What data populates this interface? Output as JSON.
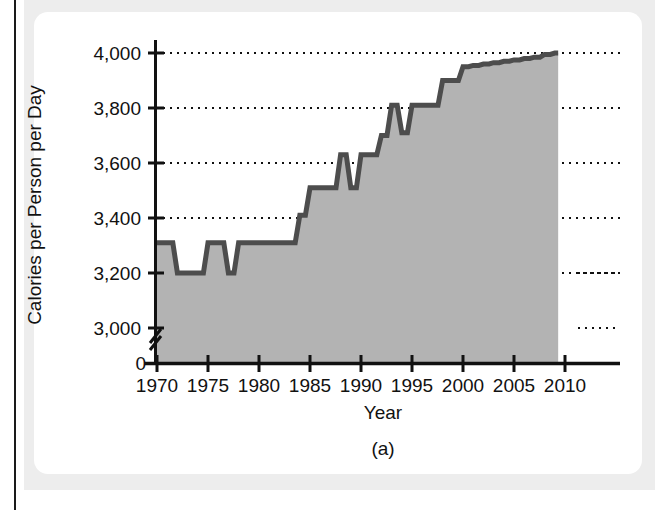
{
  "figure": {
    "caption": "(a)",
    "panel_bg": "#ffffff",
    "page_bg": "#ededed"
  },
  "chart_data": {
    "type": "area",
    "title": "",
    "subtitle": "",
    "xlabel": "Year",
    "ylabel": "Calories per Person per Day",
    "xlim": [
      1970,
      2010
    ],
    "ylim": [
      3000,
      4000
    ],
    "y_axis_break": true,
    "y_break_label": "0",
    "grid": true,
    "grid_style": "dotted-horizontal",
    "legend": "none",
    "series_color": "#4d4d4d",
    "fill_color": "#b3b3b3",
    "xticks": [
      1970,
      1975,
      1980,
      1985,
      1990,
      1995,
      2000,
      2005,
      2010
    ],
    "xtick_labels": [
      "1970",
      "1975",
      "1980",
      "1985",
      "1990",
      "1995",
      "2000",
      "2005",
      "2010"
    ],
    "yticks": [
      3000,
      3200,
      3400,
      3600,
      3800,
      4000
    ],
    "ytick_labels": [
      "3,000",
      "3,200",
      "3,400",
      "3,600",
      "3,800",
      "4,000"
    ],
    "x": [
      1970,
      1971,
      1972,
      1973,
      1974,
      1975,
      1976,
      1977,
      1978,
      1979,
      1980,
      1981,
      1982,
      1983,
      1984,
      1985,
      1986,
      1987,
      1988,
      1989,
      1990,
      1991,
      1992,
      1993,
      1994,
      1995,
      1996,
      1997,
      1998,
      1999,
      2000,
      2001,
      2002,
      2003,
      2004,
      2005,
      2006,
      2007,
      2008,
      2009
    ],
    "values": [
      3310,
      3310,
      3200,
      3200,
      3200,
      3310,
      3310,
      3200,
      3310,
      3310,
      3310,
      3310,
      3310,
      3310,
      3410,
      3510,
      3510,
      3510,
      3630,
      3510,
      3630,
      3630,
      3700,
      3810,
      3710,
      3810,
      3810,
      3810,
      3900,
      3900,
      3950,
      3955,
      3960,
      3965,
      3970,
      3975,
      3980,
      3985,
      3995,
      4000
    ],
    "units": "calories per person per day"
  }
}
